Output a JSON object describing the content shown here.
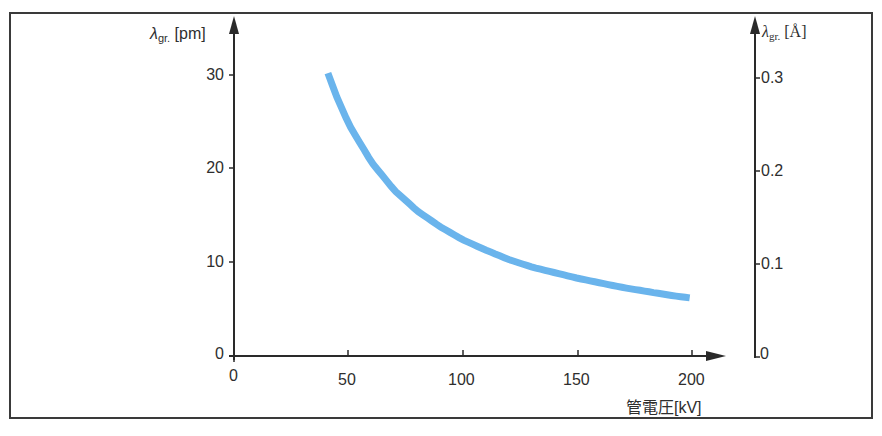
{
  "chart_data": {
    "type": "line",
    "title": "",
    "xlabel": "管電圧[kV]",
    "ylabel": "λgr. [pm]",
    "ylabel_right": "λgr. [Å]",
    "xlim": [
      0,
      200
    ],
    "ylim": [
      0,
      30
    ],
    "ylim_right": [
      0,
      0.3
    ],
    "x_ticks": [
      "0",
      "50",
      "100",
      "150",
      "200"
    ],
    "y_ticks": [
      "0",
      "10",
      "20",
      "30"
    ],
    "y_ticks_right": [
      "0",
      "0.1",
      "0.2",
      "0.3"
    ],
    "grid": false,
    "legend": null,
    "line_color": "#6ab4ec",
    "series": [
      {
        "name": "Duane-Hunt limit wavelength",
        "x": [
          41,
          45,
          50,
          60,
          70,
          80,
          90,
          100,
          110,
          120,
          130,
          140,
          150,
          160,
          170,
          180,
          190,
          199
        ],
        "values": [
          30.2,
          27.6,
          24.8,
          20.7,
          17.7,
          15.5,
          13.8,
          12.4,
          11.3,
          10.3,
          9.5,
          8.9,
          8.3,
          7.8,
          7.3,
          6.9,
          6.5,
          6.2
        ]
      }
    ]
  },
  "axes": {
    "left_title_symbol": "λ",
    "left_title_sub": "gr.",
    "left_title_unit": " [pm]",
    "right_title_symbol": "λ",
    "right_title_sub": "gr.",
    "right_title_unit": " [Å]",
    "x_title": "管電圧[kV]",
    "left_ticks": [
      "30",
      "20",
      "10",
      "0"
    ],
    "right_ticks": [
      "0.3",
      "0.2",
      "0.1",
      "0"
    ],
    "x_ticks": [
      "0",
      "50",
      "100",
      "150",
      "200"
    ]
  }
}
